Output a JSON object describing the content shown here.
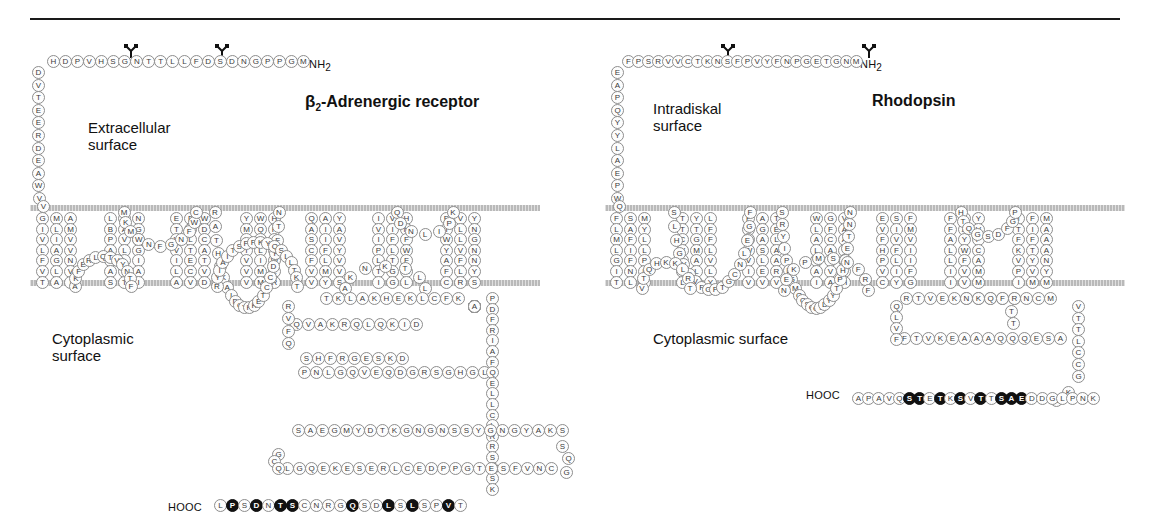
{
  "figure": {
    "panels": [
      {
        "id": "b2ar",
        "title": "β2-Adrenergic receptor",
        "title_html": "beta-2-Adrenergic receptor",
        "surface_top_label": "Extracellular\nsurface",
        "surface_bottom_label": "Cytoplasmic\nsurface",
        "n_terminus_label": "NH2",
        "c_terminus_label": "HOOC",
        "glycosylation_sites": 2,
        "n_terminal_sequence": "MGPPGNDSDFLLTTNGSHVPDHDVTEERDEAWVV",
        "transmembrane_helices": [
          {
            "index": 1,
            "columns": [
              [
                "G",
                "I",
                "V",
                "L",
                "F",
                "V",
                "T"
              ],
              [
                "M",
                "L",
                "I",
                "A",
                "G",
                "L",
                "A"
              ],
              [
                "A",
                "M",
                "V",
                "V",
                "N",
                "V",
                "I"
              ]
            ]
          },
          {
            "index": 2,
            "columns": [
              [
                "L",
                "B",
                "P",
                "A",
                "V",
                "A",
                "S"
              ],
              [
                "I",
                "A",
                "V",
                "L",
                "L",
                "C",
                "T"
              ],
              [
                "N",
                "G",
                "V",
                "G",
                "I",
                "A",
                "I"
              ]
            ]
          },
          {
            "index": 3,
            "columns": [
              [
                "E",
                "T",
                "V",
                "V",
                "I",
                "L",
                "A"
              ],
              [
                "F",
                "S",
                "L",
                "T",
                "E",
                "C",
                "V"
              ],
              [
                "W",
                "D",
                "C",
                "A",
                "T",
                "V",
                "D"
              ]
            ]
          },
          {
            "index": 4,
            "columns": [
              [
                "Y",
                "M",
                "L",
                "T",
                "V",
                "V",
                "V"
              ],
              [
                "W",
                "Q",
                "F",
                "L",
                "I",
                "M",
                "M"
              ],
              [
                "H",
                "P",
                "S",
                "S",
                "W",
                "L",
                "R"
              ]
            ]
          },
          {
            "index": 5,
            "columns": [
              [
                "Q",
                "A",
                "S",
                "C",
                "F",
                "V",
                "V"
              ],
              [
                "A",
                "I",
                "I",
                "F",
                "L",
                "M",
                "Y"
              ],
              [
                "Y",
                "A",
                "V",
                "Y",
                "V",
                "V",
                "S"
              ]
            ]
          },
          {
            "index": 6,
            "columns": [
              [
                "I",
                "V",
                "I",
                "P",
                "L",
                "T",
                "I"
              ],
              [
                "V",
                "I",
                "F",
                "L",
                "T",
                "G",
                "G"
              ],
              [
                "H",
                "N",
                "F",
                "W",
                "F",
                "M",
                "L"
              ]
            ]
          },
          {
            "index": 7,
            "columns": [
              [
                "E",
                "I",
                "W",
                "Y",
                "A",
                "F",
                "C"
              ],
              [
                "V",
                "L",
                "L",
                "V",
                "F",
                "L",
                "R"
              ],
              [
                "Y",
                "N",
                "G",
                "N",
                "N",
                "Y",
                "S"
              ]
            ]
          }
        ],
        "c_terminal_sequence": "LPSDNTSCNRGQSDLSLSPVT",
        "phospho_positions": [
          2,
          4,
          6,
          7,
          12,
          15,
          17,
          20
        ]
      },
      {
        "id": "rhodopsin",
        "title": "Rhodopsin",
        "surface_top_label": "Intradiskal\nsurface",
        "surface_bottom_label": "Cytoplasmic surface",
        "n_terminus_label": "NH2",
        "c_terminus_label": "HOOC",
        "glycosylation_sites": 2,
        "n_terminal_sequence": "MNGTEGPNFYVPFSNKTGVVRSPFEAPQYYLAEPWQ",
        "transmembrane_helices": [
          {
            "index": 1,
            "columns": [
              [
                "F",
                "L",
                "M",
                "L",
                "G",
                "I",
                "T"
              ],
              [
                "S",
                "A",
                "F",
                "I",
                "F",
                "N",
                "L"
              ],
              [
                "M",
                "Y",
                "L",
                "L",
                "P",
                "L",
                "Y"
              ]
            ]
          },
          {
            "index": 2,
            "columns": [
              [
                "T",
                "T",
                "C",
                "V",
                "D",
                "A",
                "L"
              ],
              [
                "Y",
                "T",
                "G",
                "M",
                "A",
                "L",
                "I"
              ],
              [
                "L",
                "F",
                "F",
                "L",
                "V",
                "L",
                "Y"
              ]
            ]
          },
          {
            "index": 3,
            "columns": [
              [
                "F",
                "L",
                "I",
                "W",
                "V",
                "I",
                "V"
              ],
              [
                "A",
                "G",
                "A",
                "S",
                "L",
                "E",
                "V"
              ],
              [
                "T",
                "E",
                "L",
                "A",
                "A",
                "R",
                "V"
              ]
            ]
          },
          {
            "index": 4,
            "columns": [
              [
                "W",
                "L",
                "A",
                "L",
                "W",
                "A",
                "I"
              ],
              [
                "G",
                "F",
                "C",
                "A",
                "T",
                "V",
                "A"
              ],
              [
                "V",
                "A",
                "A",
                "V",
                "F",
                "G",
                "H"
              ]
            ]
          },
          {
            "index": 5,
            "columns": [
              [
                "E",
                "V",
                "F",
                "H",
                "P",
                "V",
                "C"
              ],
              [
                "S",
                "I",
                "V",
                "F",
                "L",
                "I",
                "Y"
              ],
              [
                "F",
                "M",
                "V",
                "I",
                "I",
                "F",
                "G"
              ]
            ]
          },
          {
            "index": 6,
            "columns": [
              [
                "F",
                "F",
                "A",
                "L",
                "L",
                "I",
                "I"
              ],
              [
                "I",
                "A",
                "Y",
                "W",
                "F",
                "V",
                "V"
              ],
              [
                "Y",
                "V",
                "P",
                "C",
                "A",
                "M",
                "M"
              ]
            ]
          },
          {
            "index": 7,
            "columns": [
              [
                "I",
                "T",
                "F",
                "K",
                "V",
                "P",
                "I"
              ],
              [
                "F",
                "I",
                "F",
                "T",
                "Y",
                "V",
                "M"
              ],
              [
                "M",
                "A",
                "A",
                "A",
                "N",
                "Y",
                "M"
              ]
            ]
          }
        ],
        "c_terminal_sequence": "APAVQSTETKSVTTSAEDDGLPNK",
        "phospho_positions": [
          6,
          7,
          9,
          11,
          13,
          15,
          16,
          17
        ]
      }
    ],
    "icons": {
      "glycosylation": "glycosylation-tree-icon"
    },
    "colors": {
      "membrane": "#b9b9b9",
      "residue_stroke": "#8d8d8d",
      "residue_fill": "#fdfdfd",
      "phospho_fill": "#111111",
      "text": "#111111"
    }
  }
}
